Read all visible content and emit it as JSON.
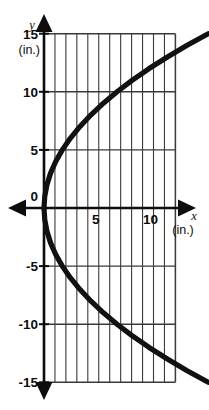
{
  "figure": {
    "background_color": "#ffffff",
    "ink_color": "#0d0d0d",
    "grid_color": "#3a3a3a",
    "curve_color": "#111111"
  },
  "axes": {
    "x_axis": {
      "variable_label": "x",
      "unit_label": "(in.)",
      "tick_labels": [
        "0",
        "5",
        "10"
      ],
      "tick_values": [
        0,
        5,
        10
      ],
      "range": [
        -2,
        13
      ],
      "arrow_both_ends": true
    },
    "y_axis": {
      "variable_label": "y",
      "unit_label": "(in.)",
      "tick_labels": [
        "15",
        "10",
        "5",
        "0",
        "-5",
        "-10",
        "-15"
      ],
      "tick_values": [
        15,
        10,
        5,
        0,
        -5,
        -10,
        -15
      ],
      "range": [
        -18,
        18
      ],
      "arrow_both_ends": true
    }
  },
  "grid": {
    "vertical_line_count": 13,
    "vertical_spacing_units": 1,
    "horizontal_spacing_units": 5,
    "x_extent_units": [
      0,
      12
    ],
    "y_extent_units": [
      -15,
      15
    ],
    "visible": true
  },
  "chart_data": {
    "type": "line",
    "title": "",
    "subtitle": "",
    "xlabel": "x (in.)",
    "ylabel": "y (in.)",
    "xlim": [
      -2,
      13
    ],
    "ylim": [
      -18,
      18
    ],
    "grid": true,
    "legend": null,
    "annotations": [],
    "series": [
      {
        "name": "Sideways parabola x = y^2/15",
        "orientation": "opens-right",
        "vertex": [
          0,
          0
        ],
        "points": [
          [
            15.0,
            -15.0
          ],
          [
            13.07,
            -14.0
          ],
          [
            11.27,
            -13.0
          ],
          [
            9.6,
            -12.0
          ],
          [
            8.07,
            -11.0
          ],
          [
            6.67,
            -10.0
          ],
          [
            5.4,
            -9.0
          ],
          [
            4.27,
            -8.0
          ],
          [
            3.27,
            -7.0
          ],
          [
            2.4,
            -6.0
          ],
          [
            1.67,
            -5.0
          ],
          [
            1.07,
            -4.0
          ],
          [
            0.6,
            -3.0
          ],
          [
            0.27,
            -2.0
          ],
          [
            0.07,
            -1.0
          ],
          [
            0.0,
            0.0
          ],
          [
            0.07,
            1.0
          ],
          [
            0.27,
            2.0
          ],
          [
            0.6,
            3.0
          ],
          [
            1.07,
            4.0
          ],
          [
            1.67,
            5.0
          ],
          [
            2.4,
            6.0
          ],
          [
            3.27,
            7.0
          ],
          [
            4.27,
            8.0
          ],
          [
            5.4,
            9.0
          ],
          [
            6.67,
            10.0
          ],
          [
            8.07,
            11.0
          ],
          [
            9.6,
            12.0
          ],
          [
            11.27,
            13.0
          ],
          [
            13.07,
            14.0
          ],
          [
            15.0,
            15.0
          ]
        ]
      }
    ]
  }
}
